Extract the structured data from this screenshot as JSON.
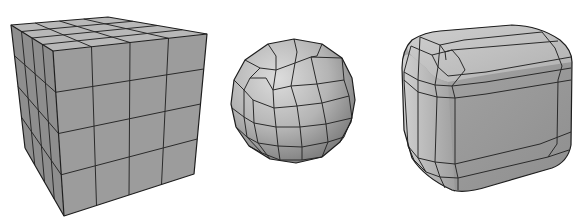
{
  "figure": {
    "description": "Three polygon mesh models shown side by side",
    "objects": [
      {
        "id": "subdivided-cube",
        "label": "Subdivided cube (4x4 grid per face)",
        "subdivisions": 4
      },
      {
        "id": "spherified-cube",
        "label": "Cube-sphere mesh"
      },
      {
        "id": "rounded-cube",
        "label": "Rounded (beveled) cube mesh"
      }
    ]
  },
  "colors": {
    "background": "#ffffff",
    "edge": "#1e1e1e",
    "cube_top": "#b8b8b8",
    "cube_front": "#9b9b9b",
    "cube_side": "#8c8c8c",
    "sphere_light": "#d4d4d4",
    "sphere_dark": "#7a7a7a"
  }
}
